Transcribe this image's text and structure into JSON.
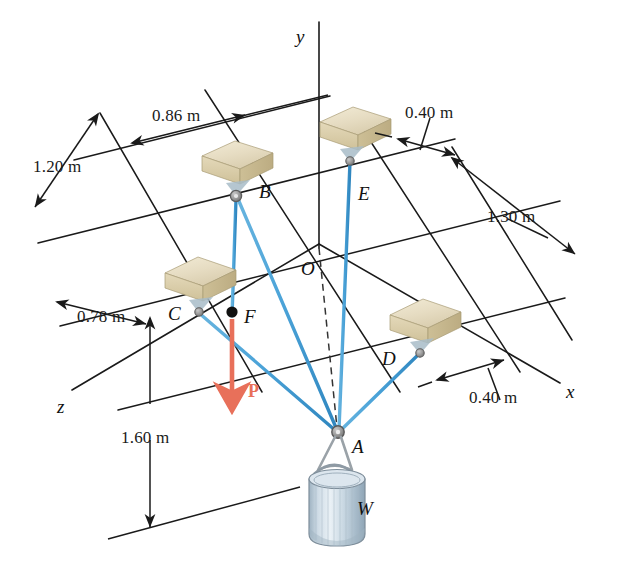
{
  "figure": {
    "background_color": "#ffffff"
  },
  "colors": {
    "cable": "#4BA3D8",
    "cable_dark": "#2F86BF",
    "force_arrow": "#E8705A",
    "grid_line": "#1a1a1a",
    "axis_line": "#1a1a1a",
    "block_top": "#E8E0C8",
    "block_front": "#D8CCA8",
    "block_side": "#C4B68E",
    "ring": "#8A8A8A",
    "drum_body": "#C6D4DE",
    "drum_top": "#DCE6EE",
    "text": "#111111"
  },
  "axes": [
    {
      "name": "y-axis",
      "label": "y",
      "x": 296,
      "y": 26
    },
    {
      "name": "x-axis",
      "label": "x",
      "x": 566,
      "y": 381
    },
    {
      "name": "z-axis",
      "label": "z",
      "x": 57,
      "y": 396
    }
  ],
  "points": [
    {
      "name": "origin",
      "label": "O",
      "x": 301,
      "y": 258,
      "px": 319,
      "py": 244
    },
    {
      "name": "point-a",
      "label": "A",
      "x": 352,
      "y": 436,
      "px": 338,
      "py": 432
    },
    {
      "name": "point-b",
      "label": "B",
      "x": 259,
      "y": 181,
      "px": 236,
      "py": 196
    },
    {
      "name": "point-c",
      "label": "C",
      "x": 168,
      "y": 303,
      "px": 198,
      "py": 312
    },
    {
      "name": "point-d",
      "label": "D",
      "x": 382,
      "y": 348,
      "px": 420,
      "py": 352
    },
    {
      "name": "point-e",
      "label": "E",
      "x": 358,
      "y": 183,
      "px": 350,
      "py": 160
    },
    {
      "name": "point-f",
      "label": "F",
      "x": 244,
      "y": 306,
      "px": 232,
      "py": 312
    }
  ],
  "dimensions": [
    {
      "name": "dim-086",
      "label": "0.86 m",
      "x": 152,
      "y": 106
    },
    {
      "name": "dim-120",
      "label": "1.20 m",
      "x": 33,
      "y": 157
    },
    {
      "name": "dim-078",
      "label": "0.78 m",
      "x": 77,
      "y": 307
    },
    {
      "name": "dim-160",
      "label": "1.60 m",
      "x": 121,
      "y": 428
    },
    {
      "name": "dim-040-top",
      "label": "0.40 m",
      "x": 405,
      "y": 103
    },
    {
      "name": "dim-130",
      "label": "1.30 m",
      "x": 487,
      "y": 207
    },
    {
      "name": "dim-040-bottom",
      "label": "0.40 m",
      "x": 469,
      "y": 388
    }
  ],
  "force": {
    "name": "applied-force-p",
    "label": "P",
    "label_x": 248,
    "label_y": 381,
    "from": {
      "x": 232,
      "y": 318
    },
    "to": {
      "x": 232,
      "y": 398
    }
  },
  "weight": {
    "name": "hanging-weight",
    "label": "W",
    "label_x": 357,
    "label_y": 498
  },
  "cables": [
    {
      "name": "cable-b-to-f",
      "from": "B",
      "to": "F"
    },
    {
      "name": "cable-b-to-a",
      "from": "B",
      "to": "A"
    },
    {
      "name": "cable-c-to-a",
      "from": "C",
      "to": "A"
    },
    {
      "name": "cable-d-to-a",
      "from": "D",
      "to": "A"
    },
    {
      "name": "cable-e-to-a",
      "from": "E",
      "to": "A"
    }
  ],
  "blocks": [
    {
      "name": "block-b",
      "anchor": "B"
    },
    {
      "name": "block-c",
      "anchor": "C"
    },
    {
      "name": "block-d",
      "anchor": "D"
    },
    {
      "name": "block-e",
      "anchor": "E"
    }
  ]
}
